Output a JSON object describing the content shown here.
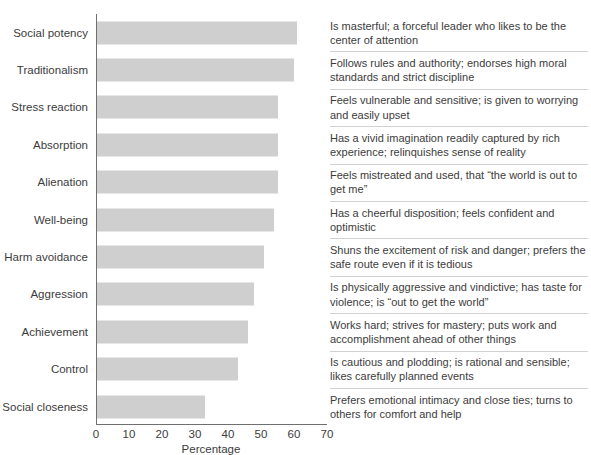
{
  "chart_data": {
    "type": "bar",
    "orientation": "horizontal",
    "title": "",
    "xlabel": "Percentage",
    "ylabel": "",
    "xlim": [
      0,
      70
    ],
    "xticks": [
      0,
      10,
      20,
      30,
      40,
      50,
      60,
      70
    ],
    "grid": false,
    "legend": false,
    "bar_color": "#cfcfcf",
    "axis_color": "#6f6f6f",
    "text_color": "#3c3c3c",
    "categories": [
      "Social potency",
      "Traditionalism",
      "Stress reaction",
      "Absorption",
      "Alienation",
      "Well-being",
      "Harm avoidance",
      "Aggression",
      "Achievement",
      "Control",
      "Social closeness"
    ],
    "values": [
      61,
      60,
      55,
      55,
      55,
      54,
      51,
      48,
      46,
      43,
      33
    ],
    "descriptions": [
      "Is masterful; a forceful leader who likes to be the center of attention",
      "Follows rules and authority; endorses high moral standards and strict discipline",
      "Feels vulnerable and sensitive; is given to worrying and easily upset",
      "Has a vivid imagination readily captured by rich experience; relinquishes sense of reality",
      "Feels mistreated and used, that “the world is out to get me”",
      "Has a cheerful disposition; feels confident and optimistic",
      "Shuns the excitement of risk and danger; prefers the safe route even if it is tedious",
      "Is physically aggressive and vindictive; has taste for violence; is “out to get the world”",
      "Works hard; strives for mastery; puts work and accomplishment ahead of other things",
      "Is cautious and plodding; is rational and sensible; likes carefully planned events",
      "Prefers emotional intimacy and close ties; turns to others for comfort and help"
    ]
  }
}
